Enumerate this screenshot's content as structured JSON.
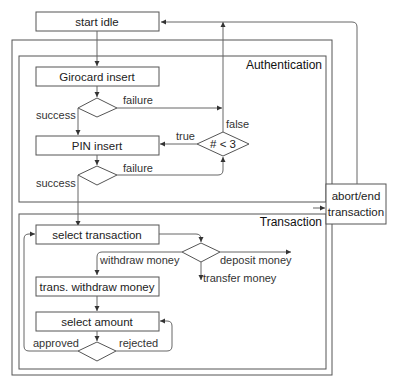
{
  "diagram": {
    "nodes": {
      "start_idle": "start idle",
      "girocard_insert": "Girocard insert",
      "pin_insert": "PIN insert",
      "attempt_check": "# < 3",
      "abort_end_line1": "abort/end",
      "abort_end_line2": "transaction",
      "select_transaction": "select transaction",
      "trans_withdraw_money": "trans. withdraw money",
      "select_amount": "select amount"
    },
    "sections": {
      "authentication": "Authentication",
      "transaction": "Transaction"
    },
    "edges": {
      "girocard_success": "success",
      "girocard_failure": "failure",
      "check_true": "true",
      "check_false": "false",
      "pin_success": "success",
      "pin_failure": "failure",
      "withdraw_money": "withdraw money",
      "deposit_money": "deposit money",
      "transfer_money": "transfer money",
      "amount_approved": "approved",
      "amount_rejected": "rejected"
    }
  }
}
